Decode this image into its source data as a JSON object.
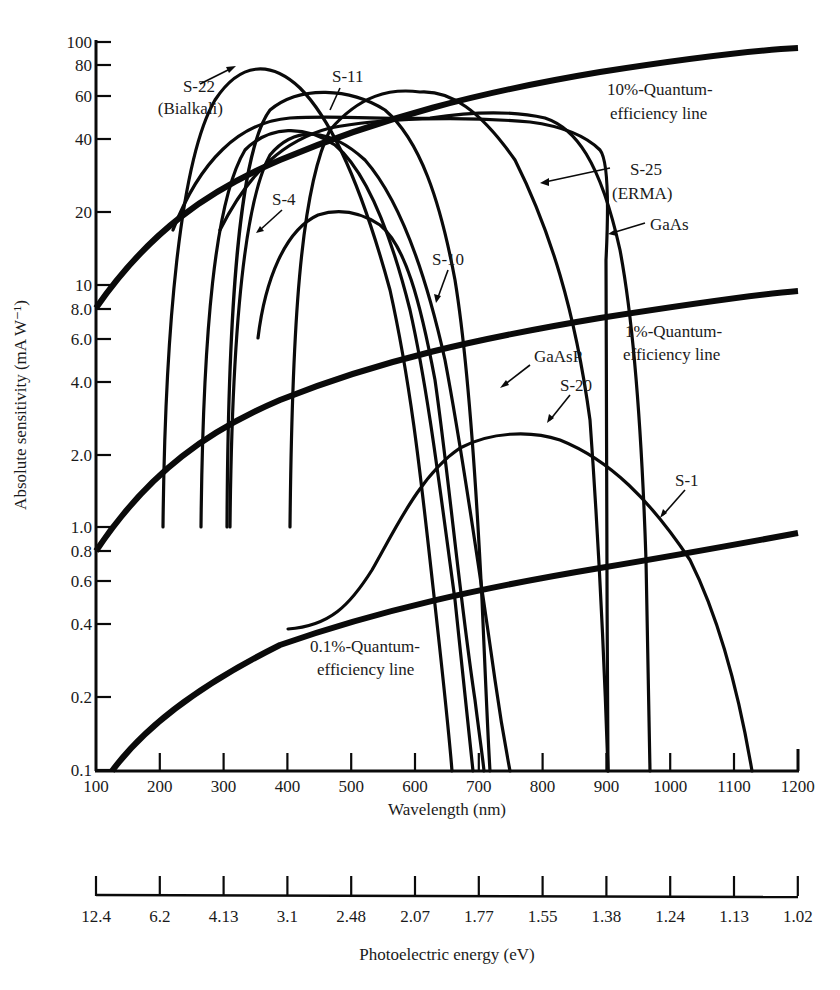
{
  "chart_data": {
    "type": "line",
    "title": "",
    "xlabel": "Wavelength (nm)",
    "ylabel": "Absolute sensitivity (mA W⁻¹)",
    "x_scale": "linear",
    "y_scale": "log",
    "xlim": [
      100,
      1200
    ],
    "ylim": [
      0.1,
      100
    ],
    "grid": false,
    "legend": "none (inline annotations with arrows)",
    "x_ticks": [
      "100",
      "200",
      "300",
      "400",
      "500",
      "600",
      "700",
      "800",
      "900",
      "1000",
      "1100",
      "1200"
    ],
    "y_ticks": [
      "100",
      "80",
      "60",
      "40",
      "20",
      "10",
      "8.0",
      "6.0",
      "4.0",
      "2.0",
      "1.0",
      "0.8",
      "0.6",
      "0.4",
      "0.2",
      "0.1"
    ],
    "secondary_x_axis": {
      "label": "Photoelectric energy (eV)",
      "ticks": [
        "12.4",
        "6.2",
        "4.13",
        "3.1",
        "2.48",
        "2.07",
        "1.77",
        "1.55",
        "1.38",
        "1.24",
        "1.13",
        "1.02"
      ]
    },
    "series": [
      {
        "name": "10%-Quantum-efficiency line",
        "x": [
          100,
          200,
          300,
          400,
          500,
          600,
          700,
          800,
          900,
          1000,
          1100,
          1200
        ],
        "y": [
          8,
          16,
          24,
          32,
          40,
          48,
          56,
          64,
          72,
          80,
          88,
          96
        ]
      },
      {
        "name": "1%-Quantum-efficiency line",
        "x": [
          100,
          200,
          300,
          400,
          500,
          600,
          700,
          800,
          900,
          1000,
          1100,
          1200
        ],
        "y": [
          0.8,
          1.6,
          2.4,
          3.2,
          4.0,
          4.8,
          5.6,
          6.4,
          7.2,
          8.0,
          8.8,
          9.6
        ]
      },
      {
        "name": "0.1%-Quantum-efficiency line",
        "x": [
          130,
          200,
          300,
          400,
          500,
          600,
          700,
          800,
          900,
          1000,
          1100,
          1200
        ],
        "y": [
          0.1,
          0.16,
          0.24,
          0.32,
          0.4,
          0.48,
          0.56,
          0.64,
          0.72,
          0.8,
          0.88,
          0.96
        ]
      },
      {
        "name": "S-22 (Bialkali)",
        "x": [
          210,
          230,
          260,
          300,
          350,
          390,
          430,
          480,
          530,
          580,
          620,
          650,
          700
        ],
        "y": [
          1.0,
          10,
          30,
          55,
          75,
          80,
          75,
          60,
          40,
          20,
          5,
          1.5,
          0.1
        ]
      },
      {
        "name": "S-11",
        "x": [
          305,
          320,
          350,
          400,
          450,
          500,
          550,
          600,
          650,
          690,
          705
        ],
        "y": [
          1.0,
          10,
          35,
          55,
          60,
          58,
          50,
          35,
          12,
          1.5,
          0.1
        ]
      },
      {
        "name": "S-4",
        "x": [
          265,
          280,
          300,
          350,
          400,
          450,
          500,
          550,
          600,
          650,
          700
        ],
        "y": [
          1.0,
          8,
          25,
          45,
          48,
          45,
          38,
          25,
          10,
          1.5,
          0.1
        ]
      },
      {
        "name": "S-10",
        "x": [
          310,
          330,
          360,
          400,
          450,
          500,
          550,
          600,
          650,
          700,
          760
        ],
        "y": [
          1.0,
          8,
          25,
          38,
          40,
          36,
          28,
          15,
          4,
          0.8,
          0.1
        ]
      },
      {
        "name": "S-25 (ERMA)",
        "x": [
          400,
          430,
          480,
          550,
          600,
          650,
          700,
          750,
          800,
          850
        ],
        "y": [
          1.0,
          15,
          40,
          60,
          63,
          58,
          45,
          25,
          6,
          0.1
        ]
      },
      {
        "name": "GaAsP",
        "x": [
          355,
          380,
          420,
          480,
          550,
          600,
          650,
          700,
          740,
          780
        ],
        "y": [
          6,
          10,
          18,
          20,
          17,
          12,
          5,
          1.0,
          0.4,
          0.1
        ]
      },
      {
        "name": "GaAs",
        "x": [
          220,
          300,
          400,
          500,
          600,
          700,
          800,
          870,
          895,
          905,
          915
        ],
        "y": [
          10,
          30,
          42,
          45,
          45,
          44,
          42,
          38,
          25,
          3,
          0.1
        ]
      },
      {
        "name": "S-20",
        "x": [
          200,
          260,
          320,
          400,
          500,
          600,
          700,
          750,
          800,
          850,
          900,
          960
        ],
        "y": [
          1.0,
          20,
          45,
          58,
          60,
          55,
          42,
          30,
          15,
          5,
          1.0,
          0.1
        ]
      },
      {
        "name": "S-1",
        "x": [
          400,
          500,
          600,
          700,
          800,
          900,
          1000,
          1050,
          1110
        ],
        "y": [
          0.4,
          0.45,
          0.9,
          1.9,
          2.4,
          1.8,
          0.7,
          0.35,
          0.1
        ]
      }
    ],
    "annotations": [
      "S-22 (Bialkali)",
      "S-11",
      "S-4",
      "S-10",
      "S-25 (ERMA)",
      "GaAs",
      "GaAsP",
      "S-20",
      "S-1",
      "10%-Quantum-efficiency line",
      "1%-Quantum-efficiency line",
      "0.1%-Quantum-efficiency line"
    ]
  },
  "labels": {
    "y_axis_title": "Absolute sensitivity (mA W⁻¹)",
    "x_axis_title": "Wavelength (nm)",
    "energy_axis_title": "Photoelectric energy (eV)",
    "qe10_line1": "10%-Quantum-",
    "qe10_line2": "efficiency line",
    "qe1_line1": "1%-Quantum-",
    "qe1_line2": "efficiency line",
    "qe01_line1": "0.1%-Quantum-",
    "qe01_line2": "efficiency line",
    "s22_line1": "S-22",
    "s22_line2": "(Bialkali)",
    "s11": "S-11",
    "s4": "S-4",
    "s10": "S-10",
    "s25_line1": "S-25",
    "s25_line2": "(ERMA)",
    "gaas": "GaAs",
    "gaasp": "GaAsP",
    "s20": "S-20",
    "s1": "S-1"
  },
  "y_ticks": [
    {
      "label": "100",
      "y": 42
    },
    {
      "label": "80",
      "y": 65
    },
    {
      "label": "60",
      "y": 96
    },
    {
      "label": "40",
      "y": 139
    },
    {
      "label": "20",
      "y": 212
    },
    {
      "label": "10",
      "y": 285
    },
    {
      "label": "8.0",
      "y": 309
    },
    {
      "label": "6.0",
      "y": 339
    },
    {
      "label": "4.0",
      "y": 382
    },
    {
      "label": "2.0",
      "y": 455
    },
    {
      "label": "1.0",
      "y": 527
    },
    {
      "label": "0.8",
      "y": 551
    },
    {
      "label": "0.6",
      "y": 581
    },
    {
      "label": "0.4",
      "y": 624
    },
    {
      "label": "0.2",
      "y": 697
    },
    {
      "label": "0.1",
      "y": 770
    }
  ],
  "x_ticks": [
    "100",
    "200",
    "300",
    "400",
    "500",
    "600",
    "700",
    "800",
    "900",
    "1000",
    "1100",
    "1200"
  ],
  "energy_ticks": [
    "12.4",
    "6.2",
    "4.13",
    "3.1",
    "2.48",
    "2.07",
    "1.77",
    "1.55",
    "1.38",
    "1.24",
    "1.13",
    "1.02"
  ]
}
